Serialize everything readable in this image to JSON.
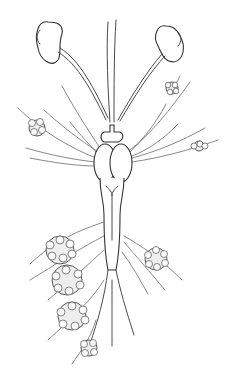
{
  "figure": {
    "colors": {
      "line": "#4a4a4a",
      "background": "#ffffff",
      "fill": "#eeeeee"
    }
  }
}
